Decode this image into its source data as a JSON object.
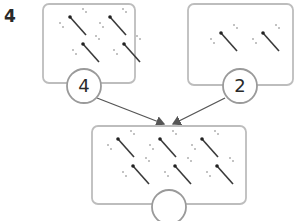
{
  "question": {
    "number": "4"
  },
  "boxes": [
    {
      "id": "left",
      "sparkler_count": 4,
      "label": "4"
    },
    {
      "id": "right",
      "sparkler_count": 2,
      "label": "2"
    },
    {
      "id": "total",
      "sparkler_count": 6,
      "label": ""
    }
  ],
  "colors": {
    "border": "#bdbdbd",
    "arrow": "#555555",
    "sparkler": "#3a3a3a"
  }
}
